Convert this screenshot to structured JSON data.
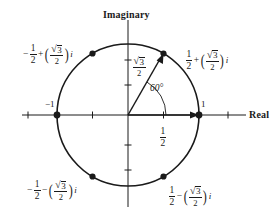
{
  "figure": {
    "background_color": "#ffffff",
    "stroke_color": "#1a1a1a"
  },
  "axes": {
    "imaginary_label": "Imaginary",
    "real_label": "Real",
    "origin": {
      "x": 128,
      "y": 115
    },
    "radius": 71,
    "real_axis": {
      "x_start": 22,
      "x_end": 246
    },
    "imaginary_axis": {
      "y_start": 20,
      "y_end": 207
    }
  },
  "tick_labels": {
    "real_negative_one": "−1",
    "real_one": "1",
    "real_half": {
      "numerator": "1",
      "denominator": "2"
    },
    "imag_sqrt3_over_2": {
      "numerator_radical": "√",
      "numerator_radicand": "3",
      "denominator": "2"
    }
  },
  "angle": {
    "value": "60",
    "degree_symbol": "°",
    "label": "60°",
    "measure_degrees": 60
  },
  "points": [
    {
      "id": "point-upper-right",
      "label": "1/2 + (√3/2)i",
      "real_num": "1",
      "real_den": "2",
      "operator": "+",
      "radicand": "3",
      "imag_den": "2",
      "imaginary_unit": "i",
      "cx": 163.5,
      "cy": 53.5,
      "label_x": 185,
      "label_y": 46
    },
    {
      "id": "point-upper-left",
      "label": "−1/2 + (√3/2)i",
      "sign": "−",
      "real_num": "1",
      "real_den": "2",
      "operator": "+",
      "radicand": "3",
      "imag_den": "2",
      "imaginary_unit": "i",
      "cx": 92.5,
      "cy": 53.5,
      "label_x": 22,
      "label_y": 46
    },
    {
      "id": "point-lower-right",
      "label": "1/2 − (√3/2)i",
      "real_num": "1",
      "real_den": "2",
      "operator": "−",
      "radicand": "3",
      "imag_den": "2",
      "imaginary_unit": "i",
      "cx": 163.5,
      "cy": 176.5,
      "label_x": 168,
      "label_y": 182
    },
    {
      "id": "point-lower-left",
      "label": "−1/2 − (√3/2)i",
      "sign": "−",
      "real_num": "1",
      "real_den": "2",
      "operator": "−",
      "radicand": "3",
      "imag_den": "2",
      "imaginary_unit": "i",
      "cx": 92.5,
      "cy": 176.5,
      "label_x": 26,
      "label_y": 182
    },
    {
      "id": "point-real-one",
      "label": "1",
      "cx": 199,
      "cy": 115
    },
    {
      "id": "point-real-negative-one",
      "label": "−1",
      "cx": 57,
      "cy": 115
    }
  ],
  "vector": {
    "id": "vector-60-degrees",
    "from_x": 128,
    "from_y": 115,
    "to_x": 163.5,
    "to_y": 53.5
  },
  "real_arrow": {
    "from_x": 128,
    "from_y": 115,
    "to_x": 199,
    "to_y": 115
  }
}
